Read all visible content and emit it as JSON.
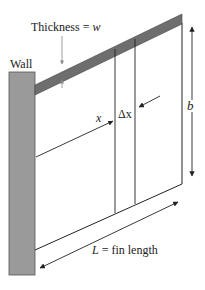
{
  "diagram": {
    "labels": {
      "wall": "Wall",
      "thickness_prefix": "Thickness = ",
      "thickness_var": "w",
      "x_var": "x",
      "delta_x": "Δx",
      "b_var": "b",
      "length_var": "L",
      "length_suffix": " = fin length"
    },
    "colors": {
      "wall_fill": "#9a9a9a",
      "fin_top_fill": "#6e6e6e",
      "line": "#222222",
      "dim_line": "#888888"
    },
    "elements": [
      "wall",
      "fin",
      "thickness-dimension",
      "x-arrow",
      "delta-x-slab",
      "b-dimension",
      "length-dimension"
    ]
  }
}
